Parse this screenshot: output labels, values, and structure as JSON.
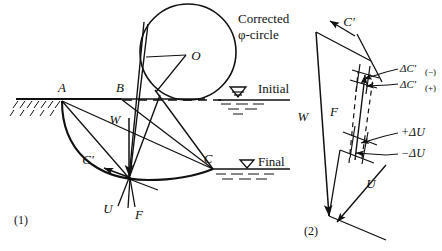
{
  "figure": {
    "title_note": "Slope stability slip-circle diagram with force polygon",
    "panel_labels": {
      "left": "(1)",
      "right": "(2)"
    },
    "colors": {
      "ink": "#111111",
      "paper": "#ffffff",
      "dashed": "#111111"
    }
  },
  "left_panel": {
    "name": "slip-circle-diagram",
    "points": {
      "a": "A",
      "b": "B",
      "c": "C",
      "o": "O"
    },
    "circle_label_line1": "Corrected",
    "circle_label_line2": "φ-circle",
    "water_levels": [
      {
        "key": "initial",
        "label": "Initial"
      },
      {
        "key": "final",
        "label": "Final"
      }
    ],
    "force_vectors": [
      {
        "key": "w",
        "label": "W"
      },
      {
        "key": "c_prime",
        "label": "C′"
      },
      {
        "key": "u",
        "label": "U"
      },
      {
        "key": "f",
        "label": "F"
      }
    ]
  },
  "right_panel": {
    "name": "force-polygon-diagram",
    "vectors": [
      {
        "key": "c_prime",
        "label": "C′"
      },
      {
        "key": "w",
        "label": "W"
      },
      {
        "key": "f",
        "label": "F"
      },
      {
        "key": "u",
        "label": "U"
      }
    ],
    "increments": [
      {
        "key": "delta_c_minus",
        "base": "ΔC′",
        "sub": "(−)"
      },
      {
        "key": "delta_c_plus",
        "base": "ΔC′",
        "sub": "(+)"
      },
      {
        "key": "delta_u_plus",
        "label": "+ΔU"
      },
      {
        "key": "delta_u_minus",
        "label": "−ΔU"
      }
    ]
  }
}
